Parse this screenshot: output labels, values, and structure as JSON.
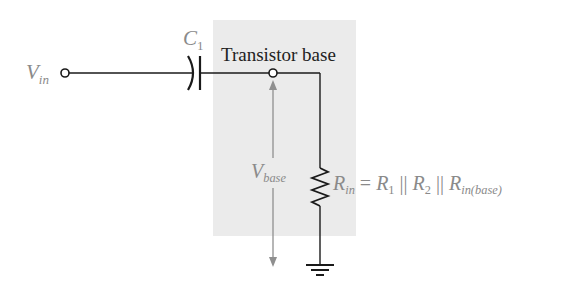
{
  "diagram": {
    "labels": {
      "vin_main": "V",
      "vin_sub": "in",
      "c1_main": "C",
      "c1_sub": "1",
      "node": "Transistor base",
      "vbase_main": "V",
      "vbase_sub": "base",
      "rin_main": "R",
      "rin_sub": "in",
      "eq": " = ",
      "r1_main": "R",
      "r1_sub": "1",
      "par1": " || ",
      "r2_main": "R",
      "r2_sub": "2",
      "par2": " || ",
      "rinb_main": "R",
      "rinb_sub": "in(base)"
    },
    "components": [
      {
        "id": "vin-terminal",
        "type": "terminal"
      },
      {
        "id": "c1",
        "type": "capacitor",
        "label": "C1"
      },
      {
        "id": "base-node",
        "type": "node",
        "label": "Transistor base"
      },
      {
        "id": "rin",
        "type": "resistor",
        "label": "Rin = R1 || R2 || Rin(base)"
      },
      {
        "id": "ground",
        "type": "ground"
      }
    ],
    "colors": {
      "wire": "#1a1a1a",
      "shade": "#ebebeb",
      "label_gray": "#8a8a8a",
      "arrow_gray": "#8f8f8f"
    }
  }
}
